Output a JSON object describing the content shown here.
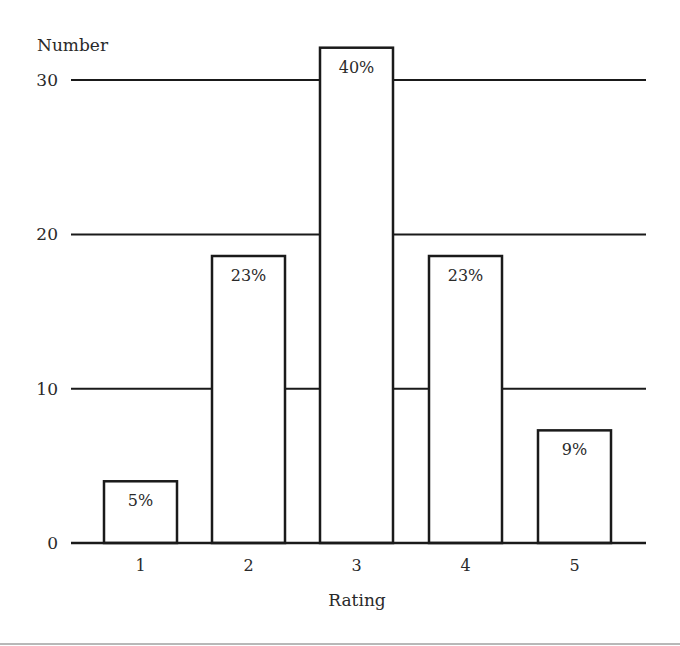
{
  "chart_data": {
    "type": "bar",
    "title": "",
    "xlabel": "Rating",
    "ylabel": "Number",
    "categories": [
      "1",
      "2",
      "3",
      "4",
      "5"
    ],
    "values": [
      4,
      18.6,
      32.1,
      18.6,
      7.3
    ],
    "data_labels": [
      "5%",
      "23%",
      "40%",
      "23%",
      "9%"
    ],
    "yticks": [
      0,
      10,
      20,
      30
    ],
    "ylim": [
      0,
      33
    ],
    "grid": "horizontal",
    "legend": null
  },
  "colors": {
    "ink": "#1a1a1a",
    "text": "#2a2a2a",
    "bar_fill": "#ffffff",
    "rule": "#b8b8b8"
  }
}
